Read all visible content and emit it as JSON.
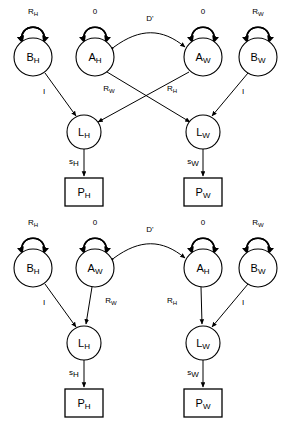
{
  "figure": {
    "type": "path-diagram",
    "stroke_color": "#000000",
    "background_color": "#ffffff"
  },
  "diagrams": [
    {
      "id": "top",
      "name": "top-diagram",
      "nodes": [
        {
          "id": "t-bh",
          "label_main": "B",
          "label_sub": "H",
          "shape": "circle",
          "cx": 33,
          "cy": 57,
          "r": 19
        },
        {
          "id": "t-ah",
          "label_main": "A",
          "label_sub": "H",
          "shape": "circle",
          "cx": 95,
          "cy": 57,
          "r": 19
        },
        {
          "id": "t-aw",
          "label_main": "A",
          "label_sub": "W",
          "shape": "circle",
          "cx": 203,
          "cy": 57,
          "r": 19
        },
        {
          "id": "t-bw",
          "label_main": "B",
          "label_sub": "W",
          "shape": "circle",
          "cx": 258,
          "cy": 57,
          "r": 19
        },
        {
          "id": "t-lh",
          "label_main": "L",
          "label_sub": "H",
          "shape": "circle",
          "cx": 84,
          "cy": 132,
          "r": 17
        },
        {
          "id": "t-lw",
          "label_main": "L",
          "label_sub": "W",
          "shape": "circle",
          "cx": 203,
          "cy": 132,
          "r": 17
        },
        {
          "id": "t-ph",
          "label_main": "P",
          "label_sub": "H",
          "shape": "box",
          "x": 65,
          "y": 178,
          "w": 38,
          "h": 28
        },
        {
          "id": "t-pw",
          "label_main": "P",
          "label_sub": "W",
          "shape": "box",
          "x": 184,
          "y": 178,
          "w": 38,
          "h": 28
        }
      ],
      "self_loops": [
        {
          "on": "t-bh",
          "label_main": "R",
          "label_sub": "H"
        },
        {
          "on": "t-ah",
          "label_main": "0",
          "label_sub": ""
        },
        {
          "on": "t-aw",
          "label_main": "0",
          "label_sub": ""
        },
        {
          "on": "t-bw",
          "label_main": "R",
          "label_sub": "W"
        }
      ],
      "edges": [
        {
          "from": "t-ah",
          "to": "t-aw",
          "style": "curved-bidirectional",
          "label_main": "D'",
          "label_sub": ""
        },
        {
          "from": "t-bh",
          "to": "t-lh",
          "style": "straight",
          "label_main": "I",
          "label_sub": ""
        },
        {
          "from": "t-ah",
          "to": "t-lw",
          "style": "straight-crossing",
          "label_main": "R",
          "label_sub": "W"
        },
        {
          "from": "t-aw",
          "to": "t-lh",
          "style": "straight-crossing",
          "label_main": "R",
          "label_sub": "H"
        },
        {
          "from": "t-bw",
          "to": "t-lw",
          "style": "straight",
          "label_main": "I",
          "label_sub": ""
        },
        {
          "from": "t-lh",
          "to": "t-ph",
          "style": "straight",
          "label_main": "s",
          "label_sub": "H"
        },
        {
          "from": "t-lw",
          "to": "t-pw",
          "style": "straight",
          "label_main": "s",
          "label_sub": "W"
        }
      ]
    },
    {
      "id": "bottom",
      "name": "bottom-diagram",
      "nodes": [
        {
          "id": "b-bh",
          "label_main": "B",
          "label_sub": "H",
          "shape": "circle",
          "cx": 33,
          "cy": 268,
          "r": 19
        },
        {
          "id": "b-aw",
          "label_main": "A",
          "label_sub": "W",
          "shape": "circle",
          "cx": 95,
          "cy": 268,
          "r": 19
        },
        {
          "id": "b-ah",
          "label_main": "A",
          "label_sub": "H",
          "shape": "circle",
          "cx": 203,
          "cy": 268,
          "r": 19
        },
        {
          "id": "b-bw",
          "label_main": "B",
          "label_sub": "W",
          "shape": "circle",
          "cx": 258,
          "cy": 268,
          "r": 19
        },
        {
          "id": "b-lh",
          "label_main": "L",
          "label_sub": "H",
          "shape": "circle",
          "cx": 84,
          "cy": 343,
          "r": 17
        },
        {
          "id": "b-lw",
          "label_main": "L",
          "label_sub": "W",
          "shape": "circle",
          "cx": 203,
          "cy": 343,
          "r": 17
        },
        {
          "id": "b-ph",
          "label_main": "P",
          "label_sub": "H",
          "shape": "box",
          "x": 65,
          "y": 389,
          "w": 38,
          "h": 28
        },
        {
          "id": "b-pw",
          "label_main": "P",
          "label_sub": "W",
          "shape": "box",
          "x": 184,
          "y": 389,
          "w": 38,
          "h": 28
        }
      ],
      "self_loops": [
        {
          "on": "b-bh",
          "label_main": "R",
          "label_sub": "H"
        },
        {
          "on": "b-aw",
          "label_main": "0",
          "label_sub": ""
        },
        {
          "on": "b-ah",
          "label_main": "0",
          "label_sub": ""
        },
        {
          "on": "b-bw",
          "label_main": "R",
          "label_sub": "W"
        }
      ],
      "edges": [
        {
          "from": "b-aw",
          "to": "b-ah",
          "style": "curved-bidirectional",
          "label_main": "D'",
          "label_sub": ""
        },
        {
          "from": "b-bh",
          "to": "b-lh",
          "style": "straight",
          "label_main": "I",
          "label_sub": ""
        },
        {
          "from": "b-aw",
          "to": "b-lh",
          "style": "straight",
          "label_main": "R",
          "label_sub": "W"
        },
        {
          "from": "b-ah",
          "to": "b-lw",
          "style": "straight",
          "label_main": "R",
          "label_sub": "H"
        },
        {
          "from": "b-bw",
          "to": "b-lw",
          "style": "straight",
          "label_main": "I",
          "label_sub": ""
        },
        {
          "from": "b-lh",
          "to": "b-ph",
          "style": "straight",
          "label_main": "s",
          "label_sub": "H"
        },
        {
          "from": "b-lw",
          "to": "b-pw",
          "style": "straight",
          "label_main": "s",
          "label_sub": "W"
        }
      ]
    }
  ],
  "labels": {
    "t_bh": "B",
    "t_bh_sub": "H",
    "t_ah": "A",
    "t_ah_sub": "H",
    "t_aw": "A",
    "t_aw_sub": "W",
    "t_bw": "B",
    "t_bw_sub": "W",
    "t_lh": "L",
    "t_lh_sub": "H",
    "t_lw": "L",
    "t_lw_sub": "W",
    "t_ph": "P",
    "t_ph_sub": "H",
    "t_pw": "P",
    "t_pw_sub": "W",
    "b_bh": "B",
    "b_bh_sub": "H",
    "b_aw": "A",
    "b_aw_sub": "W",
    "b_ah": "A",
    "b_ah_sub": "H",
    "b_bw": "B",
    "b_bw_sub": "W",
    "b_lh": "L",
    "b_lh_sub": "H",
    "b_lw": "L",
    "b_lw_sub": "W",
    "b_ph": "P",
    "b_ph_sub": "H",
    "b_pw": "P",
    "b_pw_sub": "W",
    "loop_rh": "R",
    "loop_rh_sub": "H",
    "loop_rw": "R",
    "loop_rw_sub": "W",
    "loop_zero": "0",
    "edge_dprime": "D'",
    "edge_I": "I",
    "edge_R": "R",
    "edge_R_h_sub": "H",
    "edge_R_w_sub": "W",
    "edge_s": "s",
    "edge_s_h_sub": "H",
    "edge_s_w_sub": "W"
  }
}
